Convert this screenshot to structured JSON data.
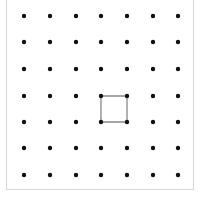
{
  "geoboard": {
    "columns": [
      24,
      50,
      76,
      101,
      127,
      153,
      178
    ],
    "rows": [
      16,
      42,
      69,
      96,
      122,
      148,
      175
    ],
    "dot_color": "#111111",
    "dot_radius": 2.2,
    "shape": {
      "type": "square",
      "stroke": "#888888",
      "vertices": [
        [
          3,
          3
        ],
        [
          4,
          3
        ],
        [
          4,
          4
        ],
        [
          3,
          4
        ]
      ]
    }
  }
}
